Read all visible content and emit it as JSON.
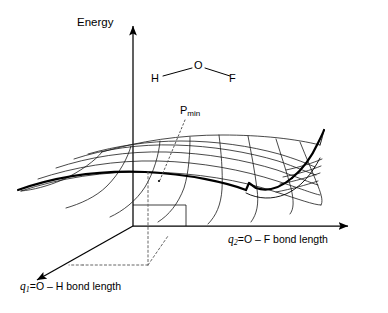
{
  "figure": {
    "type": "potential-energy-surface-diagram",
    "background_color": "#ffffff",
    "line_color": "#000000",
    "axes": {
      "vertical": {
        "label": "Energy",
        "direction": "up",
        "has_arrow": true
      },
      "right": {
        "var": "q",
        "subscript": "2",
        "equals": "=",
        "quantity": "O – F bond length",
        "full_label": "q2 = O – F bond length",
        "direction": "right",
        "has_arrow": true
      },
      "left_depth": {
        "var": "q",
        "subscript": "1",
        "equals": "=",
        "quantity": "O – H bond length",
        "full_label": "q1 = O – H bond length",
        "direction": "down-left",
        "has_arrow": true
      }
    },
    "molecule": {
      "name": "HOF",
      "geometry": "bent",
      "atoms": [
        {
          "symbol": "H",
          "x": 151,
          "y": 73
        },
        {
          "symbol": "O",
          "x": 194,
          "y": 60
        },
        {
          "symbol": "F",
          "x": 229,
          "y": 73
        }
      ],
      "bonds": [
        "H-O",
        "O-F"
      ]
    },
    "annotations": [
      {
        "name": "minimum-point",
        "text": "P",
        "subscript": "min",
        "full_label": "Pmin",
        "leader_style": "dotted",
        "marks": "surface energy minimum"
      }
    ],
    "projection_lines": {
      "style": "dashed",
      "description": "dashed drop lines from the surface minimum to the base plane and out to both bond-length axes"
    },
    "surface": {
      "style": "wireframe-mesh",
      "outline": "bold",
      "shape": "curved valley / folded sheet",
      "mesh_rows": 6,
      "mesh_cols": 9
    }
  }
}
